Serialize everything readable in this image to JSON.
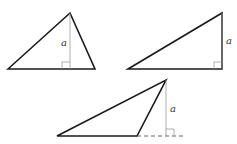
{
  "diagram": {
    "colors": {
      "stroke": "#1a1a1a",
      "altitude": "#9a9a9a"
    },
    "triangles": [
      {
        "name": "acute-triangle",
        "height_label": "a"
      },
      {
        "name": "right-triangle",
        "height_label": "a"
      },
      {
        "name": "obtuse-triangle",
        "height_label": "a"
      }
    ]
  }
}
